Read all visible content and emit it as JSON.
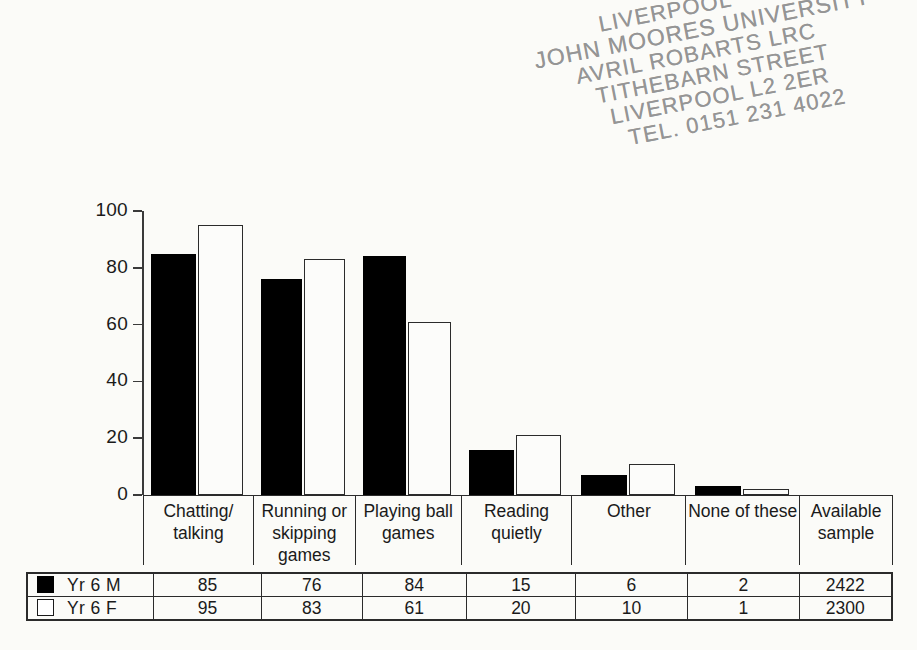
{
  "stamp": {
    "lines": [
      "LIVERPOOL",
      "JOHN MOORES UNIVERSITY",
      "AVRIL ROBARTS LRC",
      "TITHEBARN STREET",
      "LIVERPOOL L2 2ER",
      "TEL. 0151 231 4022"
    ]
  },
  "chart_data": {
    "type": "bar",
    "title": "",
    "xlabel": "",
    "ylabel": "",
    "ylim": [
      0,
      100
    ],
    "yticks": [
      0,
      20,
      40,
      60,
      80,
      100
    ],
    "ytick_labels": [
      "0",
      "20",
      "40",
      "60",
      "80",
      "100"
    ],
    "grid": false,
    "legend_position": "table-bottom-left",
    "categories": [
      "Chatting/ talking",
      "Running or skipping games",
      "Playing ball games",
      "Reading quietly",
      "Other",
      "None of these"
    ],
    "series": [
      {
        "name": "Yr 6 M",
        "values": [
          85,
          76,
          84,
          15,
          6,
          2
        ],
        "color": "#000000",
        "fill": "solid",
        "available_sample": 2422
      },
      {
        "name": "Yr 6 F",
        "values": [
          95,
          83,
          61,
          20,
          10,
          1
        ],
        "color": "#ffffff",
        "fill": "hollow",
        "available_sample": 2300
      }
    ],
    "bar_plot_values": {
      "Yr 6 M": [
        85,
        76,
        84,
        16,
        7,
        3
      ],
      "Yr 6 F": [
        95,
        83,
        61,
        21,
        11,
        2
      ]
    }
  },
  "category_table": {
    "headers": [
      "Chatting/\ntalking",
      "Running or\nskipping\ngames",
      "Playing ball\ngames",
      "Reading\nquietly",
      "Other",
      "None of these",
      "Available\nsample"
    ]
  },
  "data_table": {
    "rows": [
      {
        "swatch": "filled-square-icon",
        "label": "Yr 6 M",
        "cells": [
          "85",
          "76",
          "84",
          "15",
          "6",
          "2",
          "2422"
        ]
      },
      {
        "swatch": "hollow-square-icon",
        "label": "Yr 6 F",
        "cells": [
          "95",
          "83",
          "61",
          "20",
          "10",
          "1",
          "2300"
        ]
      }
    ]
  }
}
